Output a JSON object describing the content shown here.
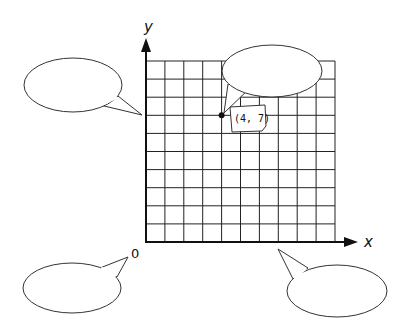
{
  "diagram": {
    "type": "coordinate-grid-with-speech-bubbles",
    "axes": {
      "x_label": "x",
      "y_label": "y",
      "origin_label": "0"
    },
    "grid": {
      "columns": 10,
      "rows": 10
    },
    "point": {
      "x": 4,
      "y": 7,
      "label": "(4, 7)"
    },
    "bubbles": [
      {
        "id": "top-right",
        "text": "",
        "points_to": "point (4, 7)"
      },
      {
        "id": "left",
        "text": "",
        "points_to": "y-axis"
      },
      {
        "id": "bottom-left",
        "text": "",
        "points_to": "origin 0"
      },
      {
        "id": "bottom-right",
        "text": "",
        "points_to": "x-axis"
      }
    ]
  }
}
